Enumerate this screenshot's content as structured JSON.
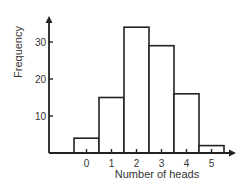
{
  "chart_data": {
    "type": "bar",
    "title": "",
    "xlabel": "Number of heads",
    "ylabel": "Frequency",
    "categories": [
      "0",
      "1",
      "2",
      "3",
      "4",
      "5"
    ],
    "values": [
      4,
      15,
      34,
      29,
      16,
      2
    ],
    "ylim": [
      0,
      38
    ],
    "yticks": [
      10,
      20,
      30
    ],
    "grid": false,
    "legend": null,
    "style": {
      "bar_fill": "#ffffff",
      "bar_stroke": "#222222",
      "axis_color": "#222222"
    }
  }
}
